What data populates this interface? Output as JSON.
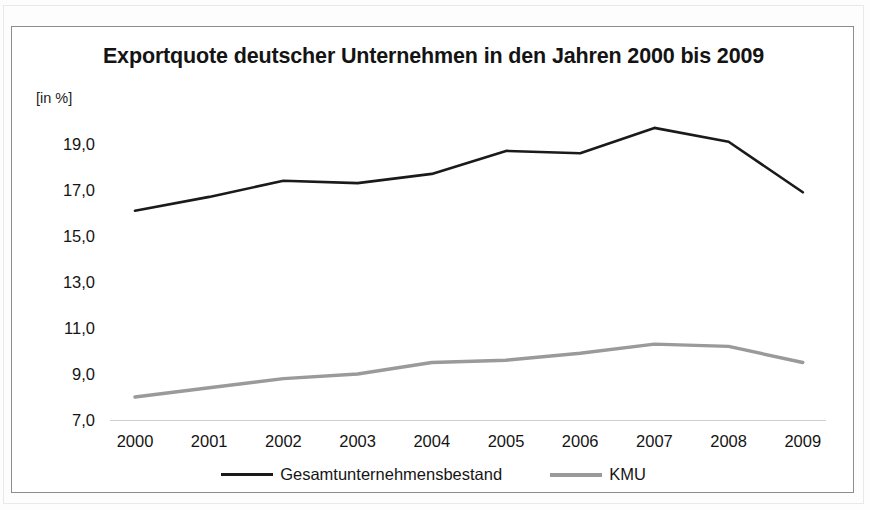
{
  "figure": {
    "title": "Exportquote deutscher Unternehmen in den Jahren 2000 bis 2009",
    "unit_label": "[in %]"
  },
  "legend": {
    "items": [
      {
        "label": "Gesamtunternehmensbestand",
        "color": "#1a1a1a"
      },
      {
        "label": "KMU",
        "color": "#9a9a9a"
      }
    ]
  },
  "axes": {
    "y_ticks": [
      "19,0",
      "17,0",
      "15,0",
      "13,0",
      "11,0",
      "9,0",
      "7,0"
    ],
    "x_ticks": [
      "2000",
      "2001",
      "2002",
      "2003",
      "2004",
      "2005",
      "2006",
      "2007",
      "2008",
      "2009"
    ]
  },
  "chart_data": {
    "type": "line",
    "title": "Exportquote deutscher Unternehmen in den Jahren 2000 bis 2009",
    "xlabel": "",
    "ylabel": "[in %]",
    "categories": [
      "2000",
      "2001",
      "2002",
      "2003",
      "2004",
      "2005",
      "2006",
      "2007",
      "2008",
      "2009"
    ],
    "series": [
      {
        "name": "Gesamtunternehmensbestand",
        "color": "#1a1a1a",
        "values": [
          16.1,
          16.7,
          17.4,
          17.3,
          17.7,
          18.7,
          18.6,
          19.7,
          19.1,
          16.9
        ]
      },
      {
        "name": "KMU",
        "color": "#9a9a9a",
        "values": [
          8.0,
          8.4,
          8.8,
          9.0,
          9.5,
          9.6,
          9.9,
          10.3,
          10.2,
          9.5
        ]
      }
    ],
    "ylim": [
      7.0,
      20.2
    ],
    "yticks": [
      7.0,
      9.0,
      11.0,
      13.0,
      15.0,
      17.0,
      19.0
    ],
    "grid": false,
    "legend_position": "bottom"
  }
}
